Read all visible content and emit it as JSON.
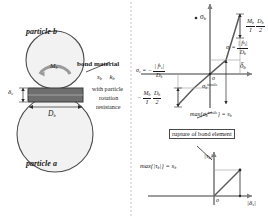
{
  "figure": {
    "domain_note": "DEM parallel-bond constitutive model schematic",
    "colors": {
      "particle_fill": "#f2f2f2",
      "particle_stroke": "#4d4d4d",
      "bond_fill": "#6e6e6e",
      "bond_stroke": "#3b3b3b",
      "axis": "#7d7d7d",
      "curve": "#5a5a5a",
      "dash_guide": "#a8a8a8",
      "divider": "#b9b9b9",
      "text": "#1a1a1a"
    }
  },
  "schematic": {
    "particle_b_label": "particle b",
    "particle_a_label": "particle a",
    "moment_label": "M",
    "moment_sub": "b",
    "gap_label": "δ",
    "gap_sub": "c",
    "diameter_label": "D",
    "diameter_sub": "b",
    "bond_title": "bond material",
    "bond_params_s": "s",
    "bond_params_s_sub": "b",
    "bond_params_k": "k",
    "bond_params_k_sub": "b",
    "bond_note_line1": "with particle",
    "bond_note_line2": "rotation",
    "bond_note_line3": "resistance"
  },
  "chart_top": {
    "type": "line",
    "title": "",
    "ylabel_sym": "σ",
    "ylabel_sub": "b",
    "xlabel_sym": "δ",
    "xlabel_sub": "b",
    "origin_label": "o",
    "annotations": {
      "moment_pos_num": "M",
      "moment_pos_num_sub": "b",
      "moment_pos_den": "I",
      "moment_pos_frac2_num": "D",
      "moment_pos_frac2_num_sub": "b",
      "moment_pos_frac2_den": "2",
      "moment_neg_prefix": "−",
      "sigma_t_lhs": "σ",
      "sigma_t_lhs_sub": "t",
      "sigma_t_eq": "=",
      "sigma_t_num": "| f",
      "sigma_t_num_sup": "b",
      "sigma_t_num_sub": "t",
      "sigma_t_num_close": "|",
      "sigma_t_den": "D",
      "sigma_t_den_sub": "b",
      "sigma_c_lhs": "σ",
      "sigma_c_lhs_sub": "c",
      "sigma_c_eq": "=",
      "sigma_c_minus": "−",
      "sigma_c_num": "| f",
      "sigma_c_num_sup": "b",
      "sigma_c_num_sub": "c",
      "sigma_c_num_close": "|",
      "sigma_c_den": "D",
      "sigma_c_den_sub": "b",
      "sigma_tensile_sym": "σ",
      "sigma_tensile_sub": "b",
      "sigma_tensile_sup": "tensile"
    },
    "axis_ranges": {
      "x": [
        -1,
        1
      ],
      "y": [
        -1,
        1
      ]
    },
    "series": [
      {
        "name": "normal bond stress vs normal displacement",
        "x": [
          -0.62,
          -0.3,
          0.3,
          0.62
        ],
        "y": [
          -0.92,
          -0.48,
          0.48,
          0.92
        ],
        "style": "piecewise-linear"
      }
    ]
  },
  "chart_bottom": {
    "type": "line",
    "ylabel_open": "|",
    "ylabel_sym": "τ",
    "ylabel_sub": "b",
    "ylabel_close": "|",
    "xlabel_open": "|",
    "xlabel_sym": "δ",
    "xlabel_sub": "s",
    "xlabel_close": "|",
    "origin_label": "o",
    "annotations": {
      "max_tau_prefix": "max{|",
      "max_tau_sym": "τ",
      "max_tau_sub": "b",
      "max_tau_mid": "|} =",
      "max_tau_rhs": "s",
      "max_tau_rhs_sub": "b",
      "max_sigma_prefix": "max{",
      "max_sigma_sym": "σ",
      "max_sigma_sub": "b",
      "max_sigma_sup": "tensile",
      "max_sigma_mid": "} =",
      "max_sigma_rhs": "s",
      "max_sigma_rhs_sub": "b",
      "rupture_box": "rupture of bond element"
    },
    "axis_ranges": {
      "x": [
        0,
        1
      ],
      "y": [
        0,
        1
      ]
    },
    "series": [
      {
        "name": "shear bond stress vs shear displacement",
        "x": [
          0,
          0.55
        ],
        "y": [
          0,
          0.8
        ],
        "style": "linear"
      }
    ]
  }
}
